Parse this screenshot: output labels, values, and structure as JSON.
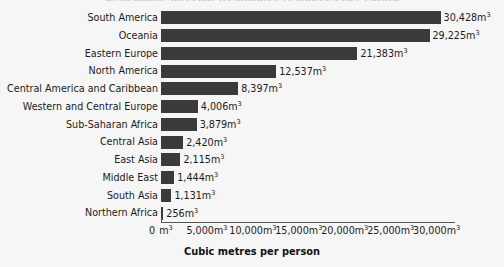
{
  "chart_data": {
    "type": "bar",
    "orientation": "horizontal",
    "title": "",
    "xlabel": "Cubic metres per person",
    "ylabel": "",
    "unit": "m3",
    "xlim": [
      0,
      32000
    ],
    "grid": false,
    "legend": null,
    "bar_color": "#3a3a3a",
    "background_color": "#f6f6f6",
    "categories": [
      "South America",
      "Oceania",
      "Eastern Europe",
      "North America",
      "Central America and Caribbean",
      "Western and Central Europe",
      "Sub-Saharan Africa",
      "Central Asia",
      "East Asia",
      "Middle East",
      "South Asia",
      "Northern Africa"
    ],
    "values": [
      30428,
      29225,
      21383,
      12537,
      8397,
      4006,
      3879,
      2420,
      2115,
      1444,
      1131,
      256
    ],
    "value_labels": [
      "30,428m",
      "29,225m",
      "21,383m",
      "12,537m",
      "8,397m",
      "4,006m",
      "3,879m",
      "2,420m",
      "2,115m",
      "1,444m",
      "1,131m",
      "256m"
    ],
    "xticks": [
      0,
      5000,
      10000,
      15000,
      20000,
      25000,
      30000
    ],
    "xtick_labels": [
      "0",
      "5,000m",
      "10,000m",
      "15,000m",
      "20,000m",
      "25,000m",
      "30,000m"
    ],
    "xtick_zero_unit": "m",
    "exponent": "3"
  },
  "title_remnant": "Renewable internal freshwater resources per capita"
}
